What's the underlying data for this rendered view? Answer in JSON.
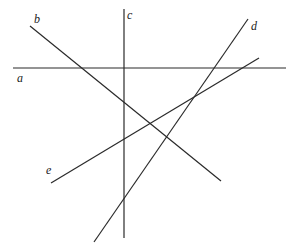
{
  "diagram": {
    "title": "",
    "canvas": {
      "width": 297,
      "height": 252,
      "background": "#ffffff"
    },
    "line_color": "#2a2a2a",
    "lines": [
      {
        "id": "a",
        "label": "a",
        "x1": 13,
        "y1": 68,
        "x2": 286,
        "y2": 68,
        "label_x": 17,
        "label_y": 82
      },
      {
        "id": "b",
        "label": "b",
        "x1": 30,
        "y1": 26,
        "x2": 221,
        "y2": 181,
        "label_x": 34,
        "label_y": 23
      },
      {
        "id": "c",
        "label": "c",
        "x1": 124,
        "y1": 9,
        "x2": 124,
        "y2": 238,
        "label_x": 127,
        "label_y": 19
      },
      {
        "id": "d",
        "label": "d",
        "x1": 248,
        "y1": 19,
        "x2": 94,
        "y2": 242,
        "label_x": 251,
        "label_y": 30
      },
      {
        "id": "e",
        "label": "e",
        "x1": 51,
        "y1": 183,
        "x2": 259,
        "y2": 58,
        "label_x": 46,
        "label_y": 174
      }
    ]
  }
}
